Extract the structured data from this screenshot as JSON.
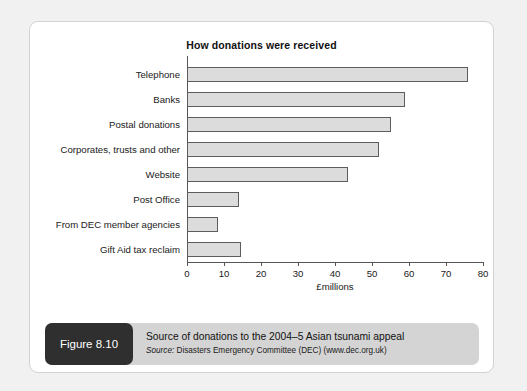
{
  "figure": {
    "badge_label": "Figure 8.10",
    "caption_title": "Source of donations to the 2004–5 Asian tsunami appeal",
    "source_prefix": "Source:",
    "source_text": " Disasters Emergency Committee (DEC) (www.dec.org.uk)"
  },
  "colors": {
    "page_background": "#f1f1f1",
    "card_background": "#ffffff",
    "bar_fill": "#dcdcdc",
    "bar_stroke": "#5d5d5d",
    "axis": "#555555",
    "badge_background": "#2f2f2f",
    "caption_band": "#d4d4d4",
    "text": "#111111"
  },
  "chart_data": {
    "type": "bar",
    "orientation": "horizontal",
    "title": "How donations were received",
    "xlabel": "£millions",
    "ylabel": "",
    "xlim": [
      0,
      80
    ],
    "xticks": [
      0,
      10,
      20,
      30,
      40,
      50,
      60,
      70,
      80
    ],
    "xtick_labels": [
      "0",
      "10",
      "20",
      "30",
      "40",
      "50",
      "60",
      "70",
      "80"
    ],
    "grid": false,
    "legend": false,
    "categories": [
      "Telephone",
      "Banks",
      "Postal donations",
      "Corporates, trusts and other",
      "Website",
      "Post Office",
      "From DEC member agencies",
      "Gift Aid tax reclaim"
    ],
    "values": [
      76,
      59,
      55,
      52,
      43.5,
      14,
      8.5,
      14.5
    ]
  }
}
